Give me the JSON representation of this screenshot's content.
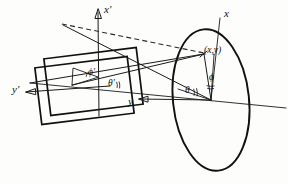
{
  "figure": {
    "background_color": "#fdfdfc",
    "ink_color": "#111111"
  },
  "labels": {
    "axis_x_primed": "x′",
    "axis_y_primed": "y′",
    "axis_x": "x",
    "axis_y": "y",
    "angle_phi_primed": "ϕ′",
    "angle_theta_primed": "θ′",
    "angle_phi": "ϕ",
    "angle_theta": "θ",
    "point_xy": "(x,y)"
  },
  "elements": {
    "ellipse": {
      "name": "projection-circle",
      "center_x": 211,
      "center_y": 100,
      "radius_x": 38,
      "radius_y": 71,
      "rotation_deg": -6
    },
    "rectangles": [
      {
        "name": "plane-rect-upper",
        "rotation_deg": -7,
        "x": 47,
        "y": 53,
        "width": 93,
        "height": 57
      },
      {
        "name": "plane-rect-lower",
        "rotation_deg": -7,
        "x": 38,
        "y": 62,
        "width": 93,
        "height": 57
      }
    ],
    "dashed_ray": {
      "name": "dashed-projection-ray",
      "from_x": 62,
      "from_y": 24,
      "to_x": 204,
      "to_y": 53
    },
    "point_marker": {
      "name": "point-xy-marker",
      "x": 204,
      "y": 54
    }
  },
  "angles": {
    "theta": {
      "description": "polar angle in base plane",
      "marker": "double-arc"
    },
    "phi": {
      "description": "azimuthal angle from x axis",
      "marker": "double-arc"
    },
    "theta_primed": {
      "description": "transformed polar angle",
      "marker": "double-arc"
    },
    "phi_primed": {
      "description": "transformed azimuthal angle",
      "marker": "single-arc"
    }
  }
}
